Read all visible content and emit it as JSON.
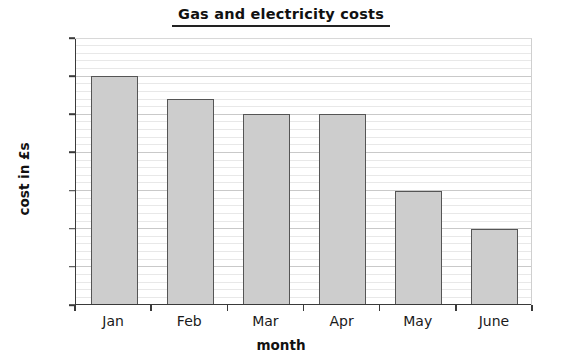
{
  "chart_data": {
    "type": "bar",
    "title": "Gas and electricity costs",
    "xlabel": "month",
    "ylabel": "cost in £s",
    "categories": [
      "Jan",
      "Feb",
      "Mar",
      "Apr",
      "May",
      "June"
    ],
    "values": [
      60,
      54,
      50,
      50,
      30,
      20
    ],
    "ylim": [
      0,
      70
    ],
    "ytick_step": 10,
    "yticks": [
      0,
      10,
      20,
      30,
      40,
      50,
      60,
      70
    ],
    "ytick_labels": [
      "0",
      "10",
      "20",
      "30",
      "40",
      "50",
      "60",
      "70"
    ],
    "minor_gridline_step": 2,
    "grid": true,
    "grid_axis": "y",
    "legend": false,
    "bar_fill_color": "#cdcdcd",
    "bar_edge_color": "#555555",
    "axis_color": "#3a3a3a",
    "gridline_color": "#e8e8e8",
    "major_gridline_color": "#c9c9c9",
    "background_color": "#ffffff",
    "title_underlined": true
  }
}
